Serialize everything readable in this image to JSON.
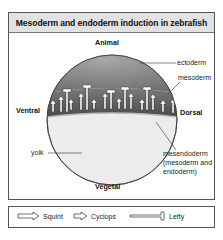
{
  "title": "Mesoderm and endoderm induction in zebrafish",
  "axes": {
    "top": "Animal",
    "bottom": "Vegetal",
    "left": "Ventral",
    "right": "Dorsal"
  },
  "regions": {
    "ectoderm": "ectoderm",
    "mesoderm": "mesoderm",
    "yolk": "yolk",
    "mesendoderm_line1": "mesendoderm",
    "mesendoderm_line2": "(mesoderm and",
    "mesendoderm_line3": "endoderm)"
  },
  "colors": {
    "ectoderm": "#8a8a8a",
    "mesoderm_band": "#5a5a5a",
    "yolk": "#ececec",
    "title_bar": "#e2e2e2"
  },
  "legend": {
    "items": [
      {
        "icon": "long-arrow-icon",
        "label": "Squint"
      },
      {
        "icon": "short-arrow-icon",
        "label": "Cyclops"
      },
      {
        "icon": "inhibitor-bar-icon",
        "label": "Lefty"
      }
    ]
  }
}
